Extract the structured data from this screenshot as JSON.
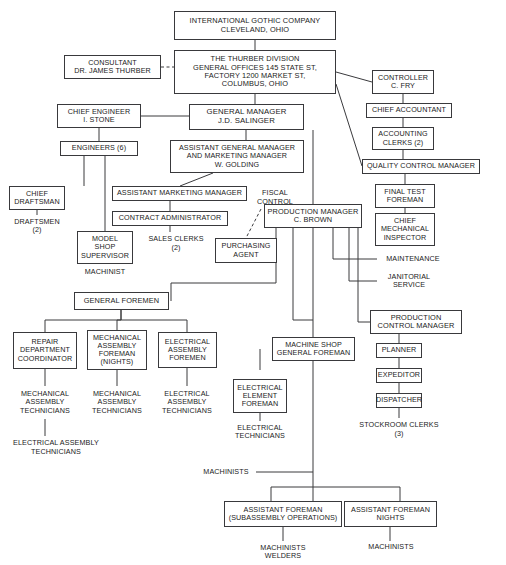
{
  "style": {
    "line_color": "#3a3a3d",
    "box_border": "#39393c",
    "text_color": "#1b1b1b",
    "background": "#ffffff"
  },
  "nodes": [
    {
      "id": "international-gothic-company",
      "label": "INTERNATIONAL GOTHIC COMPANY\nCLEVELAND, OHIO",
      "boxed": true,
      "x": 174,
      "y": 11,
      "w": 162,
      "h": 29,
      "size": 7.4
    },
    {
      "id": "thurber-division",
      "label": "THE THURBER DIVISION\nGENERAL OFFICES 145 STATE ST,\nFACTORY 1200 MARKET ST,\nCOLUMBUS, OHIO",
      "boxed": true,
      "x": 174,
      "y": 50,
      "w": 162,
      "h": 44,
      "size": 7.4
    },
    {
      "id": "consultant",
      "label": "CONSULTANT\nDR. JAMES THURBER",
      "boxed": true,
      "x": 64,
      "y": 55,
      "w": 97,
      "h": 24,
      "size": 7.2
    },
    {
      "id": "controller",
      "label": "CONTROLLER\nC. FRY",
      "boxed": true,
      "x": 372,
      "y": 70,
      "w": 62,
      "h": 24,
      "size": 7.2
    },
    {
      "id": "chief-accountant",
      "label": "CHIEF ACCOUNTANT",
      "boxed": true,
      "x": 366,
      "y": 103,
      "w": 86,
      "h": 15,
      "size": 7.2
    },
    {
      "id": "accounting-clerks",
      "label": "ACCOUNTING\nCLERKS (2)",
      "boxed": true,
      "x": 372,
      "y": 127,
      "w": 62,
      "h": 23,
      "size": 7.2
    },
    {
      "id": "quality-control-manager",
      "label": "QUALITY CONTROL MANAGER",
      "boxed": true,
      "x": 362,
      "y": 159,
      "w": 118,
      "h": 15,
      "size": 7.2
    },
    {
      "id": "chief-engineer",
      "label": "CHIEF ENGINEER\nI. STONE",
      "boxed": true,
      "x": 57,
      "y": 104,
      "w": 84,
      "h": 24,
      "size": 7.2
    },
    {
      "id": "general-manager",
      "label": "GENERAL MANAGER\nJ.D. SALINGER",
      "boxed": true,
      "x": 189,
      "y": 104,
      "w": 115,
      "h": 26,
      "size": 7.8
    },
    {
      "id": "engineers",
      "label": "ENGINEERS (6)",
      "boxed": true,
      "x": 60,
      "y": 141,
      "w": 78,
      "h": 15,
      "size": 7.2
    },
    {
      "id": "assistant-general-manager",
      "label": "ASSISTANT GENERAL MANAGER\nAND MARKETING MANAGER\nW. GOLDING",
      "boxed": true,
      "x": 170,
      "y": 140,
      "w": 134,
      "h": 33,
      "size": 7.2
    },
    {
      "id": "final-test-foreman",
      "label": "FINAL TEST\nFOREMAN",
      "boxed": true,
      "x": 375,
      "y": 184,
      "w": 60,
      "h": 24,
      "size": 7.2
    },
    {
      "id": "chief-draftsman",
      "label": "CHIEF\nDRAFTSMAN",
      "boxed": true,
      "x": 9,
      "y": 186,
      "w": 56,
      "h": 24,
      "size": 7.2
    },
    {
      "id": "assistant-marketing-manager",
      "label": "ASSISTANT MARKETING MANAGER",
      "boxed": true,
      "x": 112,
      "y": 186,
      "w": 135,
      "h": 15,
      "size": 7.2
    },
    {
      "id": "fiscal-control",
      "label": "FISCAL\nCONTROL",
      "boxed": false,
      "x": 250,
      "y": 186,
      "w": 50,
      "h": 23,
      "size": 7.2
    },
    {
      "id": "chief-mechanical-inspector",
      "label": "CHIEF\nMECHANICAL\nINSPECTOR",
      "boxed": true,
      "x": 375,
      "y": 213,
      "w": 60,
      "h": 33,
      "size": 7.2
    },
    {
      "id": "draftsmen",
      "label": "DRAFTSMEN\n(2)",
      "boxed": false,
      "x": 9,
      "y": 215,
      "w": 56,
      "h": 22,
      "size": 7.2
    },
    {
      "id": "contract-administrator",
      "label": "CONTRACT ADMINISTRATOR",
      "boxed": true,
      "x": 112,
      "y": 211,
      "w": 116,
      "h": 15,
      "size": 7.2
    },
    {
      "id": "production-manager",
      "label": "PRODUCTION MANAGER\nC. BROWN",
      "boxed": true,
      "x": 264,
      "y": 204,
      "w": 98,
      "h": 24,
      "size": 7.4
    },
    {
      "id": "model-shop-supervisor",
      "label": "MODEL\nSHOP\nSUPERVISOR",
      "boxed": true,
      "x": 77,
      "y": 231,
      "w": 56,
      "h": 33,
      "size": 7.2
    },
    {
      "id": "sales-clerks",
      "label": "SALES CLERKS\n(2)",
      "boxed": false,
      "x": 142,
      "y": 232,
      "w": 68,
      "h": 23,
      "size": 7.2
    },
    {
      "id": "purchasing-agent",
      "label": "PURCHASING\nAGENT",
      "boxed": true,
      "x": 215,
      "y": 238,
      "w": 62,
      "h": 25,
      "size": 7.2
    },
    {
      "id": "maintenance",
      "label": "MAINTENANCE",
      "boxed": false,
      "x": 377,
      "y": 253,
      "w": 72,
      "h": 12,
      "size": 7.2
    },
    {
      "id": "machinist",
      "label": "MACHINIST",
      "boxed": false,
      "x": 77,
      "y": 266,
      "w": 56,
      "h": 12,
      "size": 7.2
    },
    {
      "id": "janitorial-service",
      "label": "JANITORIAL\nSERVICE",
      "boxed": false,
      "x": 377,
      "y": 270,
      "w": 64,
      "h": 22,
      "size": 7.2
    },
    {
      "id": "general-foremen",
      "label": "GENERAL FOREMEN",
      "boxed": true,
      "x": 74,
      "y": 292,
      "w": 95,
      "h": 18,
      "size": 7.4
    },
    {
      "id": "production-control-manager",
      "label": "PRODUCTION\nCONTROL MANAGER",
      "boxed": true,
      "x": 370,
      "y": 310,
      "w": 92,
      "h": 24,
      "size": 7.4
    },
    {
      "id": "repair-department-coordinator",
      "label": "REPAIR\nDEPARTMENT\nCOORDINATOR",
      "boxed": true,
      "x": 13,
      "y": 332,
      "w": 64,
      "h": 37,
      "size": 7.2
    },
    {
      "id": "mechanical-assembly-foreman",
      "label": "MECHANICAL\nASSEMBLY\nFOREMAN\n(NIGHTS)",
      "boxed": true,
      "x": 87,
      "y": 330,
      "w": 60,
      "h": 40,
      "size": 7.2
    },
    {
      "id": "electrical-assembly-foremen",
      "label": "ELECTRICAL\nASSEMBLY\nFOREMEN",
      "boxed": true,
      "x": 158,
      "y": 332,
      "w": 59,
      "h": 36,
      "size": 7.2
    },
    {
      "id": "machine-shop-general-foreman",
      "label": "MACHINE SHOP\nGENERAL FOREMAN",
      "boxed": true,
      "x": 272,
      "y": 337,
      "w": 83,
      "h": 24,
      "size": 7.2
    },
    {
      "id": "planner",
      "label": "PLANNER",
      "boxed": true,
      "x": 376,
      "y": 343,
      "w": 46,
      "h": 15,
      "size": 7.2
    },
    {
      "id": "expeditor",
      "label": "EXPEDITOR",
      "boxed": true,
      "x": 376,
      "y": 368,
      "w": 46,
      "h": 15,
      "size": 7.2
    },
    {
      "id": "electrical-element-foreman",
      "label": "ELECTRICAL\nELEMENT\nFOREMAN",
      "boxed": true,
      "x": 233,
      "y": 379,
      "w": 54,
      "h": 34,
      "size": 7.2
    },
    {
      "id": "dispatcher",
      "label": "DISPATCHER",
      "boxed": true,
      "x": 376,
      "y": 393,
      "w": 46,
      "h": 15,
      "size": 7.2
    },
    {
      "id": "mechanical-assembly-technicians-1",
      "label": "MECHANICAL\nASSEMBLY\nTECHNICIANS",
      "boxed": false,
      "x": 13,
      "y": 386,
      "w": 64,
      "h": 33,
      "size": 7.2
    },
    {
      "id": "mechanical-assembly-technicians-2",
      "label": "MECHANICAL\nASSEMBLY\nTECHNICIANS",
      "boxed": false,
      "x": 85,
      "y": 386,
      "w": 64,
      "h": 33,
      "size": 7.2
    },
    {
      "id": "electrical-assembly-technicians-1",
      "label": "ELECTRICAL\nASSEMBLY\nTECHNICIANS",
      "boxed": false,
      "x": 156,
      "y": 386,
      "w": 62,
      "h": 33,
      "size": 7.2
    },
    {
      "id": "electrical-technicians",
      "label": "ELECTRICAL\nTECHNICIANS",
      "boxed": false,
      "x": 231,
      "y": 421,
      "w": 58,
      "h": 22,
      "size": 7.2
    },
    {
      "id": "stockroom-clerks",
      "label": "STOCKROOM CLERKS\n(3)",
      "boxed": false,
      "x": 355,
      "y": 418,
      "w": 88,
      "h": 23,
      "size": 7.2
    },
    {
      "id": "electrical-assembly-technicians-2",
      "label": "ELECTRICAL ASSEMBLY\nTECHNICIANS",
      "boxed": false,
      "x": 8,
      "y": 436,
      "w": 96,
      "h": 23,
      "size": 7.2
    },
    {
      "id": "machinists-trunk",
      "label": "MACHINISTS",
      "boxed": false,
      "x": 196,
      "y": 466,
      "w": 60,
      "h": 12,
      "size": 7.2
    },
    {
      "id": "assistant-foreman-subassembly",
      "label": "ASSISTANT FOREMAN\n(SUBASSEMBLY OPERATIONS)",
      "boxed": true,
      "x": 224,
      "y": 501,
      "w": 118,
      "h": 26,
      "size": 7.2
    },
    {
      "id": "assistant-foreman-nights",
      "label": "ASSISTANT FOREMAN\nNIGHTS",
      "boxed": true,
      "x": 344,
      "y": 501,
      "w": 93,
      "h": 26,
      "size": 7.2
    },
    {
      "id": "machinists-welders",
      "label": "MACHINISTS\nWELDERS",
      "boxed": false,
      "x": 251,
      "y": 541,
      "w": 64,
      "h": 22,
      "size": 7.2
    },
    {
      "id": "machinists-nights",
      "label": "MACHINISTS",
      "boxed": false,
      "x": 360,
      "y": 541,
      "w": 62,
      "h": 12,
      "size": 7.2
    }
  ],
  "wires": {
    "solid": [
      "M255,40 L255,50",
      "M255,94 L255,104",
      "M336,72 L372,82",
      "M336,84 L362,166",
      "M403,94 L403,103",
      "M403,118 L403,127",
      "M403,150 L403,159",
      "M405,174 L405,184",
      "M405,208 L405,213",
      "M141,116 L189,116",
      "M99,128 L99,141",
      "M84,156 L84,186",
      "M105,156 L105,231",
      "M37,210 L37,215",
      "M246,130 L246,140",
      "M213,173 L180,186",
      "M170,201 L170,211",
      "M170,226 L170,232",
      "M313,130 L313,204",
      "M276,228 L276,283 L171,283 L171,301",
      "M293,228 L293,320 L313,320",
      "M313,228 L313,501",
      "M333,228 L333,259 L377,259",
      "M349,228 L349,281 L377,281",
      "M358,228 L358,322 L370,322",
      "M121,310 L121,320 L45,320 L45,332",
      "M121,320 L117,320 L117,330",
      "M121,320 L187,320 L187,332",
      "M121,310 L121,320",
      "M260,349 L260,370 L260,370",
      "M399,334 L399,343",
      "M399,358 L399,368",
      "M399,383 L399,393",
      "M399,408 L399,418",
      "M45,369 L45,386",
      "M117,370 L117,386",
      "M187,368 L187,386",
      "M260,413 L260,421",
      "M45,419 L45,436",
      "M256,472 L313,472",
      "M271,487 L400,487",
      "M271,487 L271,501",
      "M400,487 L400,501",
      "M283,527 L283,541",
      "M390,527 L390,541"
    ],
    "dashed": [
      "M161,67 L174,67",
      "M261,209 L246,238"
    ]
  }
}
